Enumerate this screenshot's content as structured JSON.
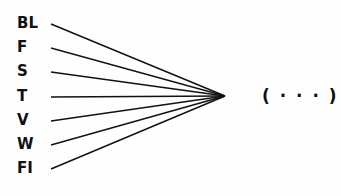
{
  "diagram": {
    "inputs": [
      {
        "label": "BL",
        "y": 24
      },
      {
        "label": "F",
        "y": 48
      },
      {
        "label": "S",
        "y": 72
      },
      {
        "label": "T",
        "y": 97
      },
      {
        "label": "V",
        "y": 121
      },
      {
        "label": "W",
        "y": 145
      },
      {
        "label": "FI",
        "y": 169
      }
    ],
    "convergence_point": {
      "x": 225,
      "y": 96
    },
    "output_label": "( · · · )",
    "line_color": "#111111"
  }
}
